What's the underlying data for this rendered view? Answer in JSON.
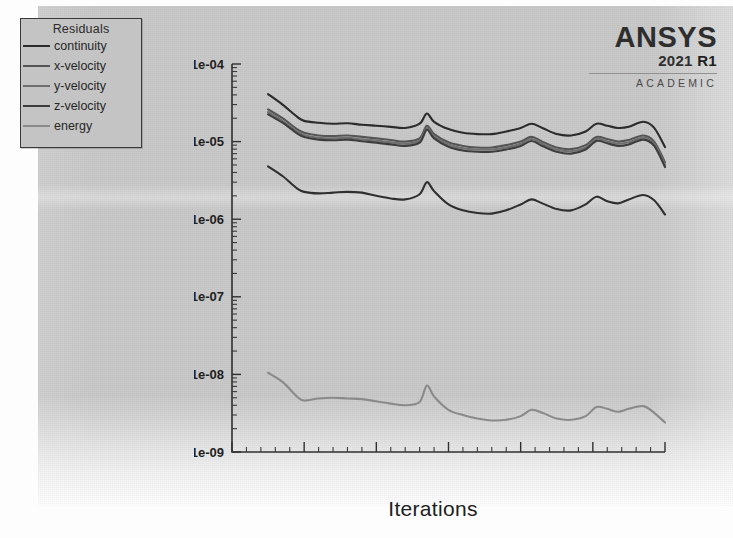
{
  "window": {
    "app": "ANSYS Fluent Residuals Plot"
  },
  "logo": {
    "brand": "ANSYS",
    "year": "2021",
    "release": "R1",
    "edition": "ACADEMIC"
  },
  "legend": {
    "title": "Residuals",
    "items": [
      {
        "label": "continuity",
        "color": "#2b2b2b"
      },
      {
        "label": "x-velocity",
        "color": "#555555"
      },
      {
        "label": "y-velocity",
        "color": "#6f6f6f"
      },
      {
        "label": "z-velocity",
        "color": "#3d3d3d"
      },
      {
        "label": "energy",
        "color": "#8a8a8a"
      }
    ]
  },
  "chart_data": {
    "type": "line",
    "title": "",
    "subtitle": "",
    "xlabel": "Iterations",
    "ylabel": "",
    "xlim": [
      0,
      6000
    ],
    "ylim": [
      1e-09,
      0.0001
    ],
    "yscale": "log",
    "xscale": "linear",
    "grid": false,
    "legend_position": "top-left",
    "xticks": [
      0,
      1000,
      2000,
      3000,
      4000,
      5000,
      6000
    ],
    "xticklabels": [
      "0",
      "1000",
      "2000",
      "3000",
      "4000",
      "5000",
      "6000"
    ],
    "yticks": [
      0.0001,
      1e-05,
      1e-06,
      1e-07,
      1e-08,
      1e-09
    ],
    "yticklabels": [
      "1e-04",
      "1e-05",
      "1e-06",
      "1e-07",
      "1e-08",
      "1e-09"
    ],
    "x": [
      500,
      700,
      900,
      1000,
      1200,
      1400,
      1600,
      1800,
      2000,
      2200,
      2400,
      2600,
      2700,
      2800,
      3000,
      3200,
      3400,
      3600,
      3800,
      4000,
      4150,
      4300,
      4500,
      4700,
      4900,
      5050,
      5200,
      5350,
      5500,
      5700,
      5850,
      6000
    ],
    "series": [
      {
        "name": "continuity",
        "color": "#2b2b2b",
        "values": [
          4.1e-05,
          3e-05,
          2.1e-05,
          1.85e-05,
          1.75e-05,
          1.7e-05,
          1.72e-05,
          1.65e-05,
          1.6e-05,
          1.55e-05,
          1.5e-05,
          1.7e-05,
          2.3e-05,
          1.8e-05,
          1.45e-05,
          1.3e-05,
          1.25e-05,
          1.25e-05,
          1.35e-05,
          1.5e-05,
          1.7e-05,
          1.5e-05,
          1.25e-05,
          1.2e-05,
          1.35e-05,
          1.7e-05,
          1.6e-05,
          1.5e-05,
          1.55e-05,
          1.8e-05,
          1.5e-05,
          8.5e-06
        ]
      },
      {
        "name": "x-velocity",
        "color": "#555555",
        "values": [
          2.6e-05,
          2e-05,
          1.45e-05,
          1.3e-05,
          1.2e-05,
          1.18e-05,
          1.2e-05,
          1.15e-05,
          1.1e-05,
          1.05e-05,
          1e-05,
          1.1e-05,
          1.6e-05,
          1.25e-05,
          9.8e-06,
          8.8e-06,
          8.4e-06,
          8.4e-06,
          9e-06,
          1e-05,
          1.15e-05,
          1e-05,
          8.4e-06,
          8e-06,
          9e-06,
          1.15e-05,
          1.08e-05,
          1e-05,
          1.05e-05,
          1.2e-05,
          1e-05,
          5.4e-06
        ]
      },
      {
        "name": "y-velocity",
        "color": "#6f6f6f",
        "values": [
          2.4e-05,
          1.85e-05,
          1.35e-05,
          1.22e-05,
          1.12e-05,
          1.1e-05,
          1.12e-05,
          1.07e-05,
          1.03e-05,
          9.8e-06,
          9.4e-06,
          1.03e-05,
          1.5e-05,
          1.17e-05,
          9.2e-06,
          8.2e-06,
          7.9e-06,
          7.9e-06,
          8.4e-06,
          9.4e-06,
          1.08e-05,
          9.4e-06,
          7.9e-06,
          7.5e-06,
          8.4e-06,
          1.08e-05,
          1.01e-05,
          9.4e-06,
          9.8e-06,
          1.13e-05,
          9.4e-06,
          5e-06
        ]
      },
      {
        "name": "z-velocity",
        "color": "#3d3d3d",
        "values": [
          2.25e-05,
          1.75e-05,
          1.28e-05,
          1.15e-05,
          1.06e-05,
          1.04e-05,
          1.06e-05,
          1.01e-05,
          9.7e-06,
          9.2e-06,
          8.8e-06,
          9.7e-06,
          1.42e-05,
          1.1e-05,
          8.6e-06,
          7.7e-06,
          7.4e-06,
          7.4e-06,
          7.9e-06,
          8.8e-06,
          1.02e-05,
          8.8e-06,
          7.4e-06,
          7e-06,
          7.9e-06,
          1.02e-05,
          9.5e-06,
          8.8e-06,
          9.2e-06,
          1.06e-05,
          8.8e-06,
          4.7e-06
        ]
      },
      {
        "name": "continuity-lower-band",
        "color": "#2f2f2f",
        "values": [
          4.8e-06,
          3.6e-06,
          2.5e-06,
          2.25e-06,
          2.15e-06,
          2.2e-06,
          2.25e-06,
          2.2e-06,
          2e-06,
          1.85e-06,
          1.8e-06,
          2.1e-06,
          3e-06,
          2.3e-06,
          1.55e-06,
          1.3e-06,
          1.2e-06,
          1.18e-06,
          1.3e-06,
          1.55e-06,
          1.8e-06,
          1.6e-06,
          1.35e-06,
          1.3e-06,
          1.55e-06,
          1.95e-06,
          1.7e-06,
          1.6e-06,
          1.8e-06,
          2.05e-06,
          1.75e-06,
          1.15e-06
        ]
      },
      {
        "name": "energy",
        "color": "#8a8a8a",
        "values": [
          1.05e-08,
          8e-09,
          5.2e-09,
          4.6e-09,
          4.9e-09,
          5e-09,
          4.9e-09,
          4.8e-09,
          4.5e-09,
          4.2e-09,
          4e-09,
          4.4e-09,
          7.2e-09,
          5.2e-09,
          3.5e-09,
          3e-09,
          2.7e-09,
          2.55e-09,
          2.6e-09,
          2.9e-09,
          3.5e-09,
          3.2e-09,
          2.7e-09,
          2.6e-09,
          2.9e-09,
          3.8e-09,
          3.6e-09,
          3.3e-09,
          3.6e-09,
          3.9e-09,
          3.2e-09,
          2.4e-09
        ]
      }
    ]
  }
}
